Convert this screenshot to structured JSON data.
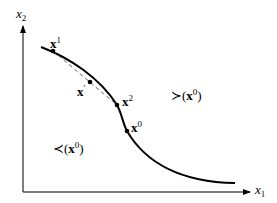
{
  "axes": {
    "x_label": {
      "base": "x",
      "sub": "1"
    },
    "y_label": {
      "base": "x",
      "sub": "2"
    }
  },
  "points": [
    {
      "id": "x1",
      "base": "x",
      "sup": "1",
      "pos": [
        53,
        51
      ]
    },
    {
      "id": "xprime",
      "base": "x",
      "sup": "′",
      "pos": [
        90,
        82
      ]
    },
    {
      "id": "x2",
      "base": "x",
      "sup": "2",
      "pos": [
        117,
        105
      ]
    },
    {
      "id": "x0",
      "base": "x",
      "sup": "0",
      "pos": [
        127,
        131
      ]
    }
  ],
  "regions": {
    "upper": {
      "symbol": "≻",
      "open": "(",
      "base": "x",
      "sup": "0",
      "close": ")"
    },
    "lower": {
      "symbol": "≺",
      "open": "(",
      "base": "x",
      "sup": "0",
      "close": ")"
    }
  },
  "colors": {
    "line": "#000000",
    "dash": "#555555"
  }
}
